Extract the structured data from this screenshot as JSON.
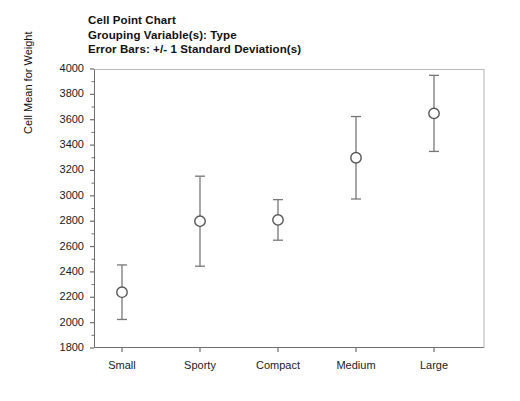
{
  "title": {
    "lines": [
      "Cell Point Chart",
      "Grouping Variable(s): Type",
      "Error Bars: +/- 1 Standard Deviation(s)"
    ]
  },
  "axes": {
    "y_title": "Cell Mean for Weight",
    "y_ticks": [
      "4000",
      "3800",
      "3600",
      "3400",
      "3200",
      "3000",
      "2800",
      "2600",
      "2400",
      "2200",
      "2000",
      "1800"
    ]
  },
  "chart_data": {
    "type": "scatter",
    "title": "Cell Point Chart",
    "subtitle": "Grouping Variable(s): Type",
    "annotation": "Error Bars: +/- 1 Standard Deviation(s)",
    "xlabel": "",
    "ylabel": "Cell Mean for Weight",
    "ylim": [
      1800,
      4000
    ],
    "ytick_step": 200,
    "grid": false,
    "legend": false,
    "error_bars": "+/- 1 Standard Deviation(s)",
    "marker": "open-circle",
    "categories": [
      "Small",
      "Sporty",
      "Compact",
      "Medium",
      "Large"
    ],
    "values": [
      2240,
      2800,
      2810,
      3300,
      3650
    ],
    "errors": [
      215,
      355,
      160,
      325,
      300
    ],
    "lower": [
      2025,
      2445,
      2650,
      2975,
      3350
    ],
    "upper": [
      2455,
      3155,
      2970,
      3625,
      3950
    ],
    "series": [
      {
        "name": "Cell Mean for Weight",
        "points": [
          {
            "category": "Small",
            "mean": 2240,
            "sd": 215,
            "lower": 2025,
            "upper": 2455
          },
          {
            "category": "Sporty",
            "mean": 2800,
            "sd": 355,
            "lower": 2445,
            "upper": 3155
          },
          {
            "category": "Compact",
            "mean": 2810,
            "sd": 160,
            "lower": 2650,
            "upper": 2970
          },
          {
            "category": "Medium",
            "mean": 3300,
            "sd": 325,
            "lower": 2975,
            "upper": 3625
          },
          {
            "category": "Large",
            "mean": 3650,
            "sd": 300,
            "lower": 3350,
            "upper": 3950
          }
        ]
      }
    ]
  },
  "colors": {
    "axis": "#6e6e6e",
    "marker": "#555555",
    "error_bar": "#777777",
    "text": "#1a1a1a"
  }
}
